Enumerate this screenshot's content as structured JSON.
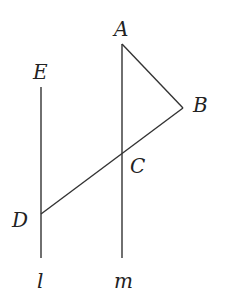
{
  "diagram": {
    "type": "geometry",
    "points": {
      "A": {
        "label": "A",
        "x": 122,
        "y": 44
      },
      "B": {
        "label": "B",
        "x": 183,
        "y": 108
      },
      "C": {
        "label": "C",
        "x": 122,
        "y": 153
      },
      "D": {
        "label": "D",
        "x": 41,
        "y": 214
      },
      "E": {
        "label": "E",
        "x": 41,
        "y": 87
      }
    },
    "lines": {
      "l": {
        "label": "l"
      },
      "m": {
        "label": "m"
      }
    },
    "segments": [
      "AB",
      "BD",
      "line l (E to bottom)",
      "line m (A to bottom)"
    ],
    "colors": {
      "stroke": "#333333",
      "text": "#222222"
    }
  }
}
